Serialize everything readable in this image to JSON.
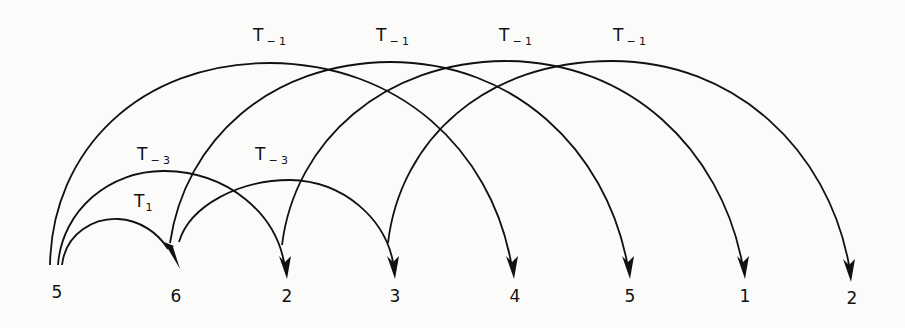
{
  "diagram": {
    "type": "arc-diagram",
    "nodes": [
      {
        "label": "5",
        "x": 57
      },
      {
        "label": "6",
        "x": 176
      },
      {
        "label": "2",
        "x": 287
      },
      {
        "label": "3",
        "x": 395
      },
      {
        "label": "4",
        "x": 515
      },
      {
        "label": "5",
        "x": 630
      },
      {
        "label": "1",
        "x": 745
      },
      {
        "label": "2",
        "x": 852
      }
    ],
    "arcs": [
      {
        "name": "T",
        "sub": "1",
        "from": 0,
        "to": 1,
        "label_x": 134,
        "label_y": 207
      },
      {
        "name": "T",
        "sub": "-3",
        "from": 0,
        "to": 2,
        "label_x": 137,
        "label_y": 160
      },
      {
        "name": "T",
        "sub": "-3",
        "from": 1,
        "to": 3,
        "label_x": 256,
        "label_y": 160
      },
      {
        "name": "T",
        "sub": "-1",
        "from": 0,
        "to": 4,
        "label_x": 253,
        "label_y": 41
      },
      {
        "name": "T",
        "sub": "-1",
        "from": 1,
        "to": 5,
        "label_x": 376,
        "label_y": 41
      },
      {
        "name": "T",
        "sub": "-1",
        "from": 2,
        "to": 6,
        "label_x": 499,
        "label_y": 41
      },
      {
        "name": "T",
        "sub": "-1",
        "from": 3,
        "to": 7,
        "label_x": 613,
        "label_y": 41
      }
    ]
  },
  "labels": {
    "n0": "5",
    "n1": "6",
    "n2": "2",
    "n3": "3",
    "n4": "4",
    "n5": "5",
    "n6": "1",
    "n7": "2",
    "a0_name": "T",
    "a0_sub": "1",
    "a1_name": "T",
    "a1_sub": "− 3",
    "a2_name": "T",
    "a2_sub": "− 3",
    "a3_name": "T",
    "a3_sub": "− 1",
    "a4_name": "T",
    "a4_sub": "− 1",
    "a5_name": "T",
    "a5_sub": "− 1",
    "a6_name": "T",
    "a6_sub": "− 1"
  }
}
